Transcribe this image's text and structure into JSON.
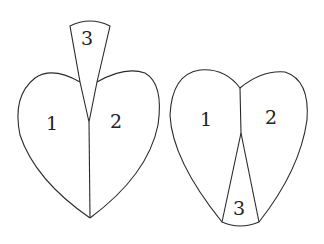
{
  "figures": [
    {
      "name": "heart-with-tab-on-top",
      "regions": [
        {
          "id": "1",
          "label": "1"
        },
        {
          "id": "2",
          "label": "2"
        },
        {
          "id": "3",
          "label": "3"
        }
      ]
    },
    {
      "name": "heart-with-wedge-at-bottom",
      "regions": [
        {
          "id": "1",
          "label": "1"
        },
        {
          "id": "2",
          "label": "2"
        },
        {
          "id": "3",
          "label": "3"
        }
      ]
    }
  ]
}
